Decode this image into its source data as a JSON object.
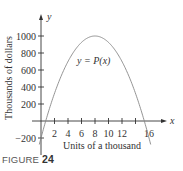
{
  "chart_data": {
    "type": "line",
    "title": "",
    "curve_label": "y = P(x)",
    "xlabel": "Units of a thousand",
    "ylabel": "Thousands of dollars",
    "x_axis_name": "x",
    "y_axis_name": "y",
    "x_ticks": [
      "2",
      "4",
      "6",
      "8",
      "10",
      "12",
      "16"
    ],
    "y_ticks": [
      "1000",
      "800",
      "600",
      "400",
      "200",
      "-200"
    ],
    "xlim": [
      0,
      17.5
    ],
    "ylim": [
      -280,
      1150
    ],
    "grid": false,
    "series": [
      {
        "name": "P(x)",
        "x": [
          0,
          1,
          2,
          3,
          4,
          5,
          6,
          7,
          8,
          9,
          10,
          11,
          12,
          13,
          14,
          15,
          16
        ],
        "values": [
          -200,
          81,
          325,
          531,
          700,
          831,
          925,
          981,
          1000,
          981,
          925,
          831,
          700,
          531,
          325,
          81,
          -200
        ]
      }
    ]
  },
  "figure": {
    "caption_prefix": "FIGURE",
    "caption_number": "24"
  }
}
